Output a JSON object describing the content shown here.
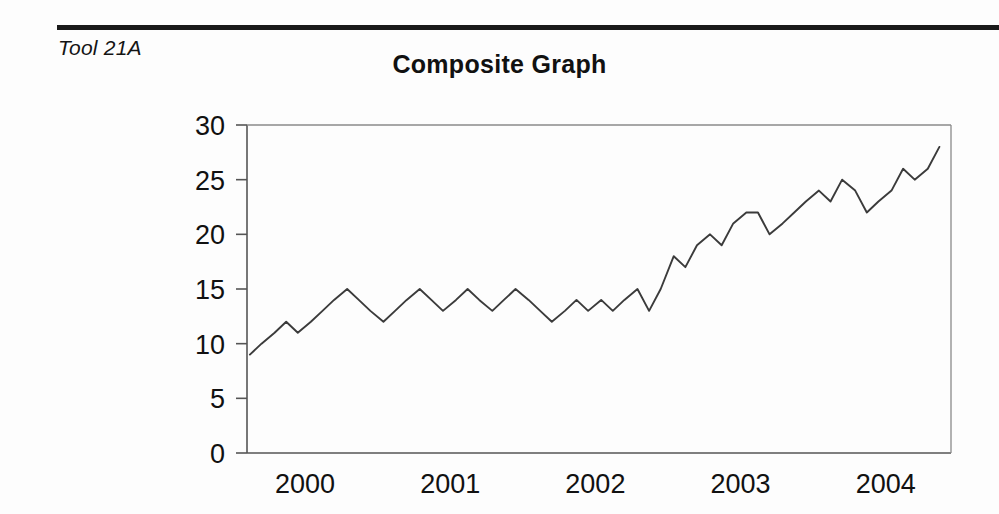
{
  "document": {
    "tool_label": "Tool 21A"
  },
  "chart_data": {
    "type": "line",
    "title": "Composite Graph",
    "xlabel": "",
    "ylabel": "",
    "grid": false,
    "legend": "none",
    "ylim": [
      0,
      30
    ],
    "yticks": [
      0,
      5,
      10,
      15,
      20,
      25,
      30
    ],
    "xtick_labels": [
      "2000",
      "2001",
      "2002",
      "2003",
      "2004"
    ],
    "xtick_values": [
      2000,
      2001,
      2002,
      2003,
      2004
    ],
    "xlim": [
      1999.6,
      2004.45
    ],
    "series": [
      {
        "name": "Composite",
        "x": [
          1999.62,
          1999.7,
          1999.79,
          1999.87,
          1999.95,
          2000.04,
          2000.12,
          2000.2,
          2000.29,
          2000.37,
          2000.45,
          2000.54,
          2000.62,
          2000.7,
          2000.79,
          2000.87,
          2000.95,
          2001.04,
          2001.12,
          2001.2,
          2001.29,
          2001.37,
          2001.45,
          2001.54,
          2001.62,
          2001.7,
          2001.79,
          2001.87,
          2001.95,
          2002.04,
          2002.12,
          2002.2,
          2002.29,
          2002.37,
          2002.45,
          2002.54,
          2002.62,
          2002.7,
          2002.79,
          2002.87,
          2002.95,
          2003.04,
          2003.12,
          2003.2,
          2003.29,
          2003.37,
          2003.45,
          2003.54,
          2003.62,
          2003.7,
          2003.79,
          2003.87,
          2003.95,
          2004.04,
          2004.12,
          2004.2,
          2004.29,
          2004.37
        ],
        "values": [
          9,
          10,
          11,
          12,
          11,
          12,
          13,
          14,
          15,
          14,
          13,
          12,
          13,
          14,
          15,
          14,
          13,
          14,
          15,
          14,
          13,
          14,
          15,
          14,
          13,
          12,
          13,
          14,
          13,
          14,
          13,
          14,
          15,
          13,
          15,
          18,
          17,
          19,
          20,
          19,
          21,
          22,
          22,
          20,
          21,
          22,
          23,
          24,
          23,
          25,
          24,
          22,
          23,
          24,
          26,
          25,
          26,
          28
        ]
      }
    ]
  }
}
